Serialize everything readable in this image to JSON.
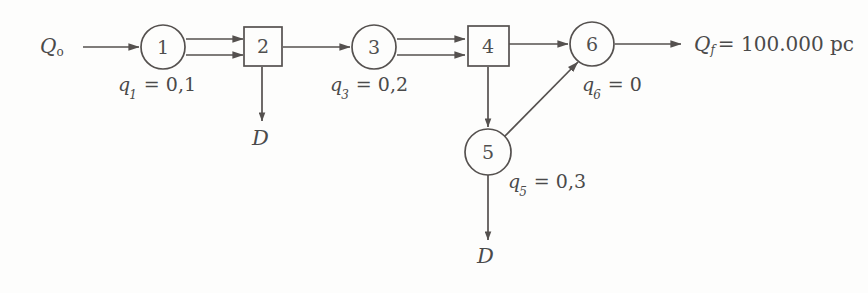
{
  "diagram": {
    "type": "flow-network",
    "stroke_color": "#55514f",
    "text_color": "#4a4a4a",
    "background_color": "#fdfdfc",
    "inflow": {
      "name": "inflow-label",
      "symbol": "Q",
      "subscript": "o",
      "text": "Q"
    },
    "outflow": {
      "name": "outflow-label",
      "symbol": "Q",
      "subscript": "f",
      "value": "= 100.000 pc",
      "text": "Q"
    },
    "nodes": [
      {
        "id": "1",
        "shape": "circle",
        "label": "1",
        "cx": 163,
        "cy": 47,
        "r": 22
      },
      {
        "id": "2",
        "shape": "square",
        "label": "2",
        "cx": 263,
        "cy": 46,
        "size": 39
      },
      {
        "id": "3",
        "shape": "circle",
        "label": "3",
        "cx": 374,
        "cy": 47,
        "r": 22
      },
      {
        "id": "4",
        "shape": "square",
        "label": "4",
        "cx": 488,
        "cy": 46,
        "size": 40
      },
      {
        "id": "5",
        "shape": "circle",
        "label": "5",
        "cx": 488,
        "cy": 152,
        "r": 22
      },
      {
        "id": "6",
        "shape": "circle",
        "label": "6",
        "cx": 592,
        "cy": 45,
        "r": 22
      }
    ],
    "q_labels": [
      {
        "name": "q1-label",
        "var": "q",
        "sub": "1",
        "rest": " = 0,1",
        "x": 118,
        "y": 84
      },
      {
        "name": "q3-label",
        "var": "q",
        "sub": "3",
        "rest": " = 0,2",
        "x": 330,
        "y": 84
      },
      {
        "name": "q6-label",
        "var": "q",
        "sub": "6",
        "rest": " = 0",
        "x": 582,
        "y": 84
      },
      {
        "name": "q5-label",
        "var": "q",
        "sub": "5",
        "rest": " = 0,3",
        "x": 508,
        "y": 180
      }
    ],
    "demand_labels": [
      {
        "name": "demand-label-node2",
        "text": "D",
        "x": 248,
        "y": 134
      },
      {
        "name": "demand-label-node5",
        "text": "D",
        "x": 473,
        "y": 252
      }
    ],
    "edges": [
      {
        "name": "edge-inflow-to-1",
        "from": "inflow",
        "to": "1",
        "style": "single"
      },
      {
        "name": "edge-1-to-2-upper",
        "from": "1",
        "to": "2",
        "style": "double"
      },
      {
        "name": "edge-1-to-2-lower",
        "from": "1",
        "to": "2",
        "style": "double"
      },
      {
        "name": "edge-2-to-3",
        "from": "2",
        "to": "3",
        "style": "single"
      },
      {
        "name": "edge-3-to-4-upper",
        "from": "3",
        "to": "4",
        "style": "double"
      },
      {
        "name": "edge-3-to-4-lower",
        "from": "3",
        "to": "4",
        "style": "double"
      },
      {
        "name": "edge-4-to-6",
        "from": "4",
        "to": "6",
        "style": "single"
      },
      {
        "name": "edge-6-to-outflow",
        "from": "6",
        "to": "outflow",
        "style": "single"
      },
      {
        "name": "edge-2-to-demand",
        "from": "2",
        "to": "D",
        "style": "single"
      },
      {
        "name": "edge-4-to-5",
        "from": "4",
        "to": "5",
        "style": "single"
      },
      {
        "name": "edge-5-to-6",
        "from": "5",
        "to": "6",
        "style": "diagonal"
      },
      {
        "name": "edge-5-to-demand",
        "from": "5",
        "to": "D",
        "style": "single"
      }
    ]
  }
}
